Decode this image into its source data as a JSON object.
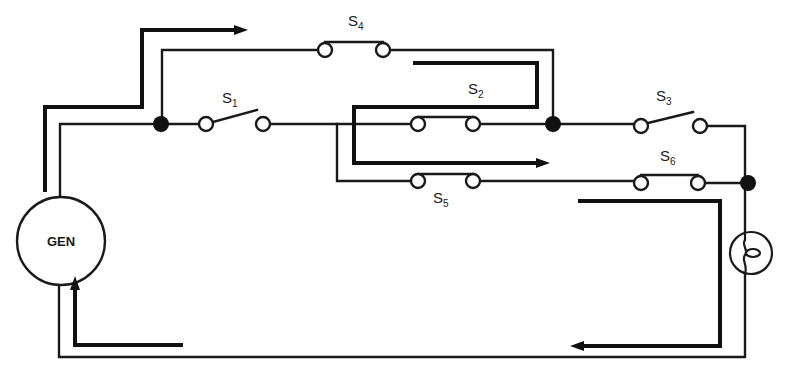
{
  "diagram": {
    "type": "electrical circuit schematic with current-flow arrows",
    "background": "#ffffff",
    "ink_color": "#1a1a1a",
    "generator": {
      "label": "GEN"
    },
    "lamp": {
      "symbol": "lamp-filament"
    },
    "switches": [
      {
        "id": "S1",
        "letter": "S",
        "sub": "1",
        "state": "open"
      },
      {
        "id": "S2",
        "letter": "S",
        "sub": "2",
        "state": "closed"
      },
      {
        "id": "S3",
        "letter": "S",
        "sub": "3",
        "state": "open"
      },
      {
        "id": "S4",
        "letter": "S",
        "sub": "4",
        "state": "closed"
      },
      {
        "id": "S5",
        "letter": "S",
        "sub": "5",
        "state": "closed"
      },
      {
        "id": "S6",
        "letter": "S",
        "sub": "6",
        "state": "closed"
      }
    ],
    "junctions": 3,
    "flow_arrows": [
      {
        "segment": "GEN up to top, right toward S4",
        "direction": "right"
      },
      {
        "segment": "return under S4, left then down past S2",
        "direction": "right"
      },
      {
        "segment": "lamp down to bottom return",
        "direction": "left"
      },
      {
        "segment": "bottom return to GEN",
        "direction": "up"
      }
    ]
  }
}
